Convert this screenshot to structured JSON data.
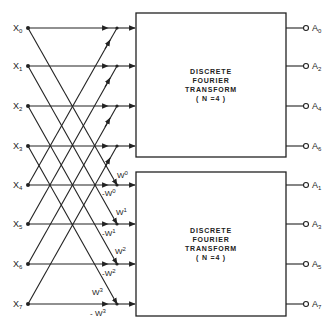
{
  "diagram": {
    "type": "fft-butterfly-decimation-in-frequency",
    "inputs": [
      {
        "label": "X",
        "sub": "0",
        "y": 28
      },
      {
        "label": "X",
        "sub": "1",
        "y": 66
      },
      {
        "label": "X",
        "sub": "2",
        "y": 106
      },
      {
        "label": "X",
        "sub": "3",
        "y": 146
      },
      {
        "label": "X",
        "sub": "4",
        "y": 185
      },
      {
        "label": "X",
        "sub": "5",
        "y": 224
      },
      {
        "label": "X",
        "sub": "6",
        "y": 264
      },
      {
        "label": "X",
        "sub": "7",
        "y": 304
      }
    ],
    "twiddles": [
      {
        "pos": "W",
        "pos_sup": "0",
        "neg": "-W",
        "neg_sup": "0"
      },
      {
        "pos": "W",
        "pos_sup": "1",
        "neg": "-W",
        "neg_sup": "1"
      },
      {
        "pos": "W",
        "pos_sup": "2",
        "neg": "-W",
        "neg_sup": "2"
      },
      {
        "pos": "W",
        "pos_sup": "3",
        "neg": "- W",
        "neg_sup": "3"
      }
    ],
    "blocks": [
      {
        "line1": "DISCRETE",
        "line2": "FOURIER",
        "line3": "TRANSFORM",
        "line4": "( N =4 )",
        "outputs": [
          {
            "label": "A",
            "sub": "0"
          },
          {
            "label": "A",
            "sub": "2"
          },
          {
            "label": "A",
            "sub": "4"
          },
          {
            "label": "A",
            "sub": "6"
          }
        ]
      },
      {
        "line1": "DISCRETE",
        "line2": "FOURIER",
        "line3": "TRANSFORM",
        "line4": "( N =4 )",
        "outputs": [
          {
            "label": "A",
            "sub": "1"
          },
          {
            "label": "A",
            "sub": "3"
          },
          {
            "label": "A",
            "sub": "5"
          },
          {
            "label": "A",
            "sub": "7"
          }
        ]
      }
    ]
  }
}
